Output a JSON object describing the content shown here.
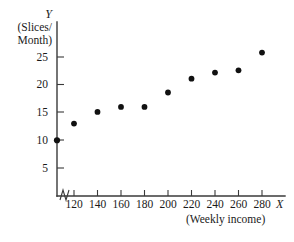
{
  "chart_data": {
    "type": "scatter",
    "title": "",
    "subtitle": "",
    "xlabel": "X",
    "xlabel_caption": "(Weekly income)",
    "ylabel": "Y",
    "ylabel_caption_line1": "(Slices/",
    "ylabel_caption_line2": "Month)",
    "x": [
      120,
      140,
      160,
      180,
      200,
      220,
      240,
      260,
      280
    ],
    "values": [
      13.0,
      15.1,
      16.0,
      16.0,
      18.6,
      21.1,
      22.2,
      22.6,
      25.8
    ],
    "series": [
      {
        "name": "Pizza slices per month vs weekly income",
        "points": [
          {
            "x": 120,
            "y": 13.0
          },
          {
            "x": 140,
            "y": 15.1
          },
          {
            "x": 160,
            "y": 16.0
          },
          {
            "x": 180,
            "y": 16.0
          },
          {
            "x": 200,
            "y": 18.6
          },
          {
            "x": 220,
            "y": 21.1
          },
          {
            "x": 240,
            "y": 22.2
          },
          {
            "x": 260,
            "y": 22.6
          },
          {
            "x": 280,
            "y": 25.8
          }
        ]
      }
    ],
    "axis_intercept_point": {
      "x": null,
      "y": 10.0,
      "note": "marker drawn on the Y axis at Y = 10"
    },
    "xticks": [
      120,
      140,
      160,
      180,
      200,
      220,
      240,
      260,
      280
    ],
    "xtick_labels": [
      "120",
      "140",
      "160",
      "180",
      "200",
      "220",
      "240",
      "260",
      "280"
    ],
    "yticks": [
      5,
      10,
      15,
      20,
      25
    ],
    "ytick_labels": [
      "5",
      "10",
      "15",
      "20",
      "25"
    ],
    "xlim": [
      110,
      295
    ],
    "ylim": [
      0,
      28
    ],
    "grid": false,
    "legend": false,
    "legend_position": "none",
    "axis_break_x": true,
    "marker": "filled-circle",
    "marker_color": "#111111",
    "axis_color": "#3a3a3a",
    "background_color": "#ffffff"
  },
  "axes": {
    "y_title_name": "Y",
    "y_title_line1": "(Slices/",
    "y_title_line2": "Month)",
    "x_title_name": "X",
    "x_title_caption": "(Weekly income)"
  },
  "ytick_labels": {
    "t0": "5",
    "t1": "10",
    "t2": "15",
    "t3": "20",
    "t4": "25"
  },
  "xtick_labels": {
    "t0": "120",
    "t1": "140",
    "t2": "160",
    "t3": "180",
    "t4": "200",
    "t5": "220",
    "t6": "240",
    "t7": "260",
    "t8": "280"
  }
}
